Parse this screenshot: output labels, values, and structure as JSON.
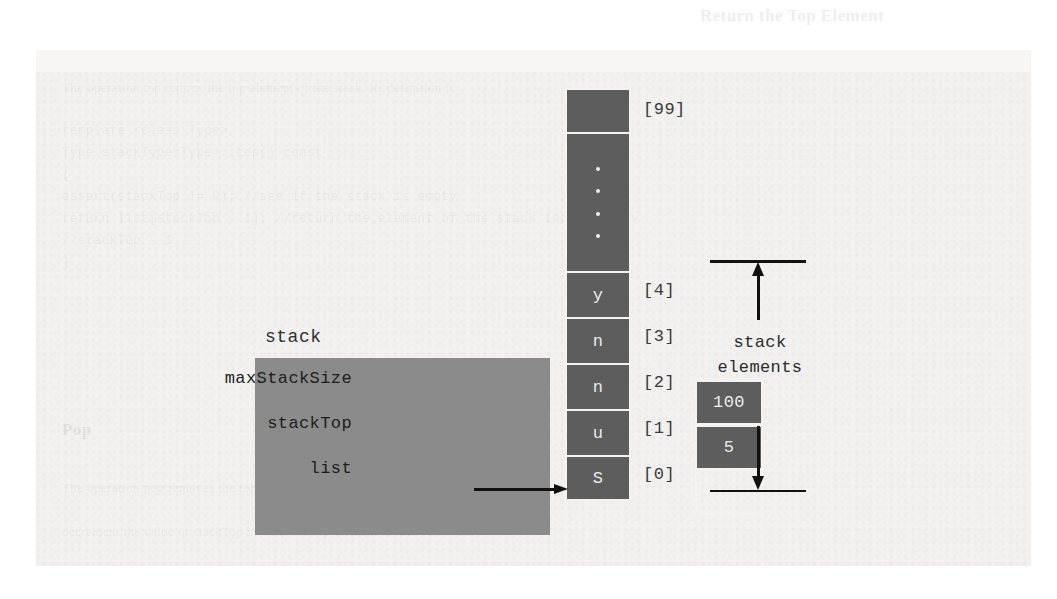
{
  "array": {
    "top_cell": {
      "index_label": "[99]",
      "value": ""
    },
    "ellipsis_dots": 4,
    "cells": [
      {
        "index_label": "[4]",
        "value": "y"
      },
      {
        "index_label": "[3]",
        "value": "n"
      },
      {
        "index_label": "[2]",
        "value": "n"
      },
      {
        "index_label": "[1]",
        "value": "u"
      },
      {
        "index_label": "[0]",
        "value": "S"
      }
    ]
  },
  "stack_object": {
    "label": "stack",
    "fields": [
      {
        "name": "maxStackSize",
        "value": "100",
        "filled": true
      },
      {
        "name": "stackTop",
        "value": "5",
        "filled": true
      },
      {
        "name": "list",
        "value": "",
        "filled": false
      }
    ]
  },
  "annotation": {
    "brace_label_line1": "stack",
    "brace_label_line2": "elements"
  },
  "ghost_text": {
    "heading": "Return the Top Element",
    "lines": [
      "The operation top returns the top element of the stack. Its definition is",
      "template <class Type>",
      "Type stackType<Type>::top() const",
      "{",
      "    assert(stackTop != 0);   //see if the stack is empty",
      "    return list[stackTop - 1];   //return the element of the stack indicated by",
      "                                 //stackTop - 1",
      "}",
      "Pop",
      "The operation pop removes the top element.",
      "decrement the value of stackTop by one; the top element is then removed."
    ]
  },
  "colors": {
    "page": "#f2f1ef",
    "panel_gray": "#8b8b8b",
    "cell_dark": "#5d5d5d",
    "cell_border": "#f4f3f1",
    "ink": "#111111"
  }
}
